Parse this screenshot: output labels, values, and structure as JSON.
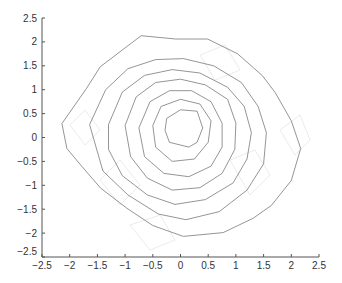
{
  "chart_data": {
    "type": "contour",
    "title": "",
    "xlabel": "",
    "ylabel": "",
    "xlim": [
      -2.5,
      2.5
    ],
    "ylim": [
      -2.5,
      2.5
    ],
    "grid": false,
    "legend": null,
    "xticks": [
      -2.5,
      -2,
      -1.5,
      -1,
      -0.5,
      0,
      0.5,
      1,
      1.5,
      2,
      2.5
    ],
    "yticks": [
      -2.5,
      -2,
      -1.5,
      -1,
      -0.5,
      0,
      0.5,
      1,
      1.5,
      2,
      2.5
    ],
    "xtick_labels": [
      "−2.5",
      "−2",
      "−1.5",
      "−1",
      "−0.5",
      "0",
      "0.5",
      "1",
      "1.5",
      "2",
      "2.5"
    ],
    "ytick_labels": [
      "−2.5",
      "−2",
      "−1.5",
      "−1",
      "−0.5",
      "0",
      "0.5",
      "1",
      "1.5",
      "2",
      "2.5"
    ],
    "line_color": "#7a7a7a",
    "contours": [
      {
        "level": 1,
        "points": [
          [
            -2.14,
            0.29
          ],
          [
            -1.7,
            1.02
          ],
          [
            -1.45,
            1.48
          ],
          [
            -0.71,
            2.13
          ],
          [
            -0.09,
            2.06
          ],
          [
            0.49,
            2.06
          ],
          [
            1.03,
            1.75
          ],
          [
            1.48,
            1.29
          ],
          [
            1.71,
            0.94
          ],
          [
            2.0,
            0.35
          ],
          [
            2.17,
            -0.23
          ],
          [
            2.0,
            -0.9
          ],
          [
            1.64,
            -1.42
          ],
          [
            1.31,
            -1.69
          ],
          [
            0.77,
            -1.99
          ],
          [
            0.05,
            -2.07
          ],
          [
            -0.5,
            -1.84
          ],
          [
            -0.97,
            -1.48
          ],
          [
            -1.44,
            -1.06
          ],
          [
            -1.8,
            -0.58
          ],
          [
            -2.05,
            -0.23
          ],
          [
            -2.14,
            0.29
          ]
        ]
      },
      {
        "level": 2,
        "points": [
          [
            -1.64,
            0.27
          ],
          [
            -1.35,
            1.0
          ],
          [
            -0.95,
            1.44
          ],
          [
            -0.45,
            1.63
          ],
          [
            0.05,
            1.65
          ],
          [
            0.6,
            1.5
          ],
          [
            1.1,
            1.15
          ],
          [
            1.4,
            0.65
          ],
          [
            1.55,
            0.1
          ],
          [
            1.5,
            -0.55
          ],
          [
            1.2,
            -1.1
          ],
          [
            0.7,
            -1.55
          ],
          [
            0.1,
            -1.72
          ],
          [
            -0.4,
            -1.6
          ],
          [
            -0.95,
            -1.2
          ],
          [
            -1.4,
            -0.7
          ],
          [
            -1.64,
            0.27
          ]
        ]
      },
      {
        "level": 3,
        "points": [
          [
            -1.3,
            0.27
          ],
          [
            -1.05,
            0.95
          ],
          [
            -0.65,
            1.3
          ],
          [
            -0.15,
            1.42
          ],
          [
            0.35,
            1.35
          ],
          [
            0.85,
            1.05
          ],
          [
            1.15,
            0.65
          ],
          [
            1.28,
            0.1
          ],
          [
            1.2,
            -0.45
          ],
          [
            0.95,
            -0.95
          ],
          [
            0.45,
            -1.3
          ],
          [
            -0.1,
            -1.4
          ],
          [
            -0.6,
            -1.2
          ],
          [
            -1.05,
            -0.8
          ],
          [
            -1.3,
            -0.25
          ],
          [
            -1.3,
            0.27
          ]
        ]
      },
      {
        "level": 4,
        "points": [
          [
            -1.0,
            0.25
          ],
          [
            -0.8,
            0.85
          ],
          [
            -0.45,
            1.15
          ],
          [
            0.0,
            1.22
          ],
          [
            0.45,
            1.1
          ],
          [
            0.85,
            0.8
          ],
          [
            1.0,
            0.3
          ],
          [
            0.98,
            -0.25
          ],
          [
            0.75,
            -0.75
          ],
          [
            0.35,
            -1.05
          ],
          [
            -0.15,
            -1.1
          ],
          [
            -0.6,
            -0.85
          ],
          [
            -0.9,
            -0.4
          ],
          [
            -1.0,
            0.25
          ]
        ]
      },
      {
        "level": 5,
        "points": [
          [
            -0.75,
            0.2
          ],
          [
            -0.55,
            0.75
          ],
          [
            -0.2,
            0.98
          ],
          [
            0.2,
            0.98
          ],
          [
            0.55,
            0.75
          ],
          [
            0.75,
            0.3
          ],
          [
            0.75,
            -0.2
          ],
          [
            0.55,
            -0.6
          ],
          [
            0.15,
            -0.82
          ],
          [
            -0.3,
            -0.75
          ],
          [
            -0.65,
            -0.4
          ],
          [
            -0.75,
            0.2
          ]
        ]
      },
      {
        "level": 6,
        "points": [
          [
            -0.5,
            0.25
          ],
          [
            -0.35,
            0.65
          ],
          [
            0.0,
            0.8
          ],
          [
            0.35,
            0.7
          ],
          [
            0.55,
            0.35
          ],
          [
            0.5,
            -0.1
          ],
          [
            0.25,
            -0.45
          ],
          [
            -0.15,
            -0.5
          ],
          [
            -0.45,
            -0.2
          ],
          [
            -0.5,
            0.25
          ]
        ]
      },
      {
        "level": 7,
        "points": [
          [
            -0.25,
            0.4
          ],
          [
            0.0,
            0.58
          ],
          [
            0.3,
            0.55
          ],
          [
            0.4,
            0.2
          ],
          [
            0.3,
            -0.1
          ],
          [
            0.15,
            -0.2
          ],
          [
            -0.2,
            -0.1
          ],
          [
            -0.28,
            0.15
          ],
          [
            -0.25,
            0.4
          ]
        ]
      }
    ]
  }
}
